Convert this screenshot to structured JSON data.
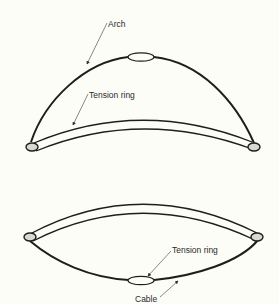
{
  "figure": {
    "top_diagram": {
      "labels": {
        "arch": "Arch",
        "tension_ring": "Tension ring"
      }
    },
    "bottom_diagram": {
      "labels": {
        "tension_ring": "Tension ring",
        "cable": "Cable"
      }
    },
    "colors": {
      "stroke": "#1e1e1e",
      "ring_fill": "#d9d9d4",
      "background": "#fdfdf8"
    }
  }
}
